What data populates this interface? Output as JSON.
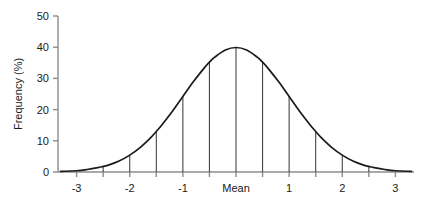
{
  "chart_data": {
    "type": "line",
    "title": "",
    "subtitle": "",
    "xlabel": "",
    "ylabel": "Frequency (%)",
    "xlim": [
      -3.35,
      3.35
    ],
    "ylim": [
      0,
      50
    ],
    "grid": false,
    "legend": null,
    "x_tick_labels": [
      "-3",
      "-2",
      "-1",
      "Mean",
      "1",
      "2",
      "3"
    ],
    "x_tick_values": [
      -3,
      -2,
      -1,
      0,
      1,
      2,
      3
    ],
    "x_minor_tick_values": [
      -2.5,
      -1.5,
      -0.5,
      0.5,
      1.5,
      2.5
    ],
    "y_tick_labels": [
      "0",
      "10",
      "20",
      "30",
      "40",
      "50"
    ],
    "y_tick_values": [
      0,
      10,
      20,
      30,
      40,
      50
    ],
    "series": [
      {
        "name": "normal-distribution",
        "description": "Normal (Gaussian) probability density curve, mean 0, sd 1, expressed as percent",
        "color": "#1a1a1a",
        "x": [
          -3.3,
          -3.0,
          -2.8,
          -2.6,
          -2.5,
          -2.4,
          -2.2,
          -2.0,
          -1.8,
          -1.6,
          -1.5,
          -1.4,
          -1.2,
          -1.0,
          -0.8,
          -0.6,
          -0.5,
          -0.4,
          -0.2,
          0.0,
          0.2,
          0.4,
          0.5,
          0.6,
          0.8,
          1.0,
          1.2,
          1.4,
          1.5,
          1.6,
          1.8,
          2.0,
          2.2,
          2.4,
          2.5,
          2.6,
          2.8,
          3.0,
          3.3
        ],
        "y": [
          0.2,
          0.4,
          0.8,
          1.4,
          1.8,
          2.2,
          3.5,
          5.4,
          7.9,
          11.1,
          13.0,
          15.0,
          19.4,
          24.2,
          29.0,
          33.3,
          35.2,
          36.8,
          39.1,
          39.9,
          39.1,
          36.8,
          35.2,
          33.3,
          29.0,
          24.2,
          19.4,
          15.0,
          13.0,
          11.1,
          7.9,
          5.4,
          3.5,
          2.2,
          1.8,
          1.4,
          0.8,
          0.4,
          0.2
        ]
      }
    ],
    "drop_lines": {
      "description": "Vertical ordinate lines drawn from the x-axis up to the curve at each half standard deviation",
      "color": "#3c3c3c",
      "x": [
        -2.5,
        -2.0,
        -1.5,
        -1.0,
        -0.5,
        0.0,
        0.5,
        1.0,
        1.5,
        2.0,
        2.5
      ],
      "y": [
        1.8,
        5.4,
        13.0,
        24.2,
        35.2,
        39.9,
        35.2,
        24.2,
        13.0,
        5.4,
        1.8
      ]
    },
    "axis_color": "#8c8c8c",
    "background_color": "#ffffff"
  }
}
